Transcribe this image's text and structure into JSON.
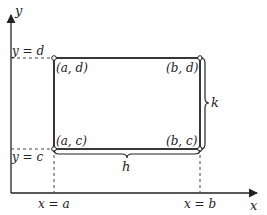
{
  "diagram": {
    "type": "rectangle-region-in-plane",
    "colors": {
      "line": "#222222",
      "dash": "#444444",
      "background": "#ffffff"
    },
    "axes": {
      "x_label": "x",
      "y_label": "y"
    },
    "guides": {
      "y_d_label": "y = d",
      "y_c_label": "y = c",
      "x_a_label": "x = a",
      "x_b_label": "x = b"
    },
    "corners": {
      "top_left": "(a, d)",
      "top_right": "(b, d)",
      "bottom_left": "(a, c)",
      "bottom_right": "(b, c)"
    },
    "dimensions": {
      "width_label": "h",
      "height_label": "k"
    }
  }
}
